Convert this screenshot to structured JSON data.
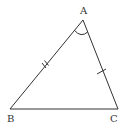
{
  "diagram": {
    "type": "triangle",
    "stroke_color": "#333333",
    "vertices": [
      {
        "label": "A",
        "x": 83,
        "y": 20
      },
      {
        "label": "B",
        "x": 10,
        "y": 109
      },
      {
        "label": "C",
        "x": 118,
        "y": 109
      }
    ],
    "marks": {
      "AB": "double-tick",
      "AC": "single-tick",
      "angle_A": "arc"
    }
  }
}
